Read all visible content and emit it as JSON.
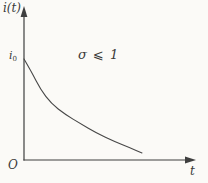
{
  "figure": {
    "ylabel": "i(t)",
    "xlabel": "t",
    "origin_label": "O",
    "intercept_base": "i",
    "intercept_sub": "0",
    "annotation": "σ ⩽ 1"
  },
  "colors": {
    "background": "#fbfaf7",
    "axis_line": "#3f3f3f",
    "curve_line": "#474747",
    "text": "#3a3a3a"
  },
  "chart_data": {
    "type": "line",
    "title": "",
    "xlabel": "t",
    "ylabel": "i(t)",
    "annotation": "σ ⩽ 1",
    "y_intercept_label": "i0",
    "origin_label": "O",
    "x_units": "arbitrary (axis unlabeled, no ticks)",
    "y_units": "fraction of initial value i0",
    "xlim": [
      0,
      1.45
    ],
    "ylim": [
      0,
      1.5
    ],
    "grid": false,
    "legend": false,
    "series": [
      {
        "name": "i(t) exponential decay, σ ⩽ 1",
        "x": [
          0,
          0.06,
          0.14,
          0.23,
          0.35,
          0.48,
          0.61,
          0.77,
          0.9,
          1.0
        ],
        "y": [
          1.0,
          0.88,
          0.7,
          0.56,
          0.45,
          0.36,
          0.27,
          0.18,
          0.12,
          0.07
        ]
      }
    ]
  }
}
